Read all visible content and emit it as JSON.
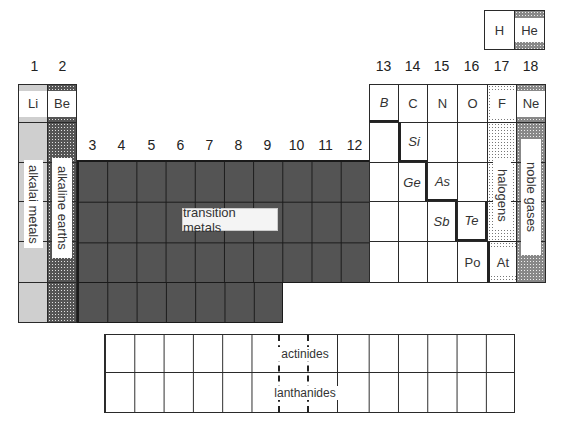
{
  "diagram": {
    "type": "periodic-table-groups",
    "group_numbers_left": [
      "1",
      "2"
    ],
    "group_numbers_transition": [
      "3",
      "4",
      "5",
      "6",
      "7",
      "8",
      "9",
      "10",
      "11",
      "12"
    ],
    "group_numbers_right": [
      "13",
      "14",
      "15",
      "16",
      "17",
      "18"
    ],
    "period1": {
      "h": "H",
      "he": "He"
    },
    "period2": {
      "li": "Li",
      "be": "Be",
      "b": "B",
      "c": "C",
      "n": "N",
      "o": "O",
      "f": "F",
      "ne": "Ne"
    },
    "metalloids": {
      "si": "Si",
      "ge": "Ge",
      "as": "As",
      "sb": "Sb",
      "te": "Te"
    },
    "others": {
      "po": "Po",
      "at": "At"
    },
    "labels": {
      "alkali_metals": "alkalai metals",
      "alkaline_earths": "alkaline earths",
      "transition_metals": "transition metals",
      "halogens": "halogens",
      "noble_gases": "noble gases",
      "actinides": "actinides",
      "lanthanides": "lanthanides"
    },
    "colors": {
      "alkali": "#cfcfcf",
      "transition": "#545454",
      "border": "#2a2a2a",
      "background": "#ffffff"
    }
  }
}
